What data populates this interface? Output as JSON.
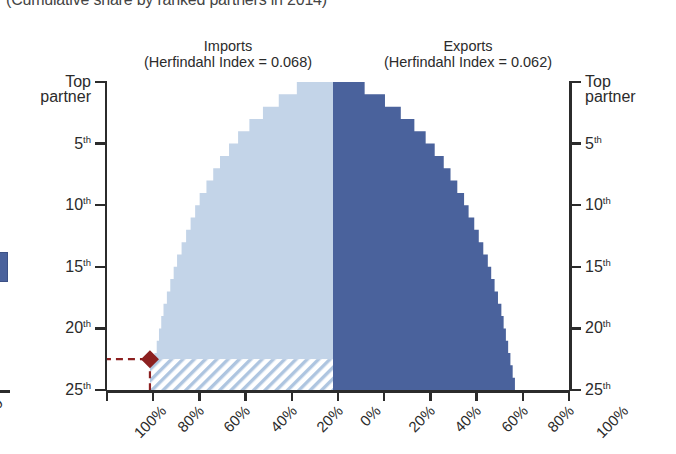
{
  "title": "(Cumulative share by ranked partners in 2014)",
  "headers": {
    "imports": {
      "name": "Imports",
      "sub": "(Herfindahl Index = 0.068)"
    },
    "exports": {
      "name": "Exports",
      "sub": "(Herfindahl Index = 0.062)"
    }
  },
  "axis_left": {
    "labels_top": "Top",
    "labels_top2": "partner",
    "ticks": [
      "5",
      "10",
      "15",
      "20",
      "25"
    ],
    "suffix": "th"
  },
  "axis_right": {
    "labels_top": "Top",
    "labels_top2": "partner",
    "ticks": [
      "5",
      "10",
      "15",
      "20",
      "25"
    ],
    "suffix": "th"
  },
  "axis_bottom": {
    "labels": [
      "100%",
      "80%",
      "60%",
      "40%",
      "20%",
      "0%",
      "20%",
      "40%",
      "60%",
      "80%",
      "100%"
    ],
    "clipped_left_label": "0"
  },
  "colors": {
    "imports_fill": "#c3d4e8",
    "exports_fill": "#4a629c",
    "hatch": "#aac3de",
    "marker": "#8c2020",
    "axis": "#2b2b2b"
  },
  "marker": {
    "name": "threshold-diamond",
    "rank": 22.5,
    "share_percent": 81
  },
  "chart_data": {
    "type": "area",
    "title": "(Cumulative share by ranked partners in 2014)",
    "xlabel": "",
    "ylabel": "Partner rank",
    "xlim": [
      -100,
      100
    ],
    "ylim": [
      1,
      25
    ],
    "grid": false,
    "legend": "none",
    "orientation": "horizontal-mirrored",
    "axis_note": "Left half shows Imports cumulative share growing right-to-left from 0% at center; right half shows Exports cumulative share growing left-to-right from 0% at center.",
    "ranks": [
      1,
      2,
      3,
      4,
      5,
      6,
      7,
      8,
      9,
      10,
      11,
      12,
      13,
      14,
      15,
      16,
      17,
      18,
      19,
      20,
      21,
      22,
      23,
      24,
      25
    ],
    "series": [
      {
        "name": "Imports",
        "herfindahl_index": 0.068,
        "side": "left",
        "cumulative_share_percent": [
          16,
          24,
          31,
          37,
          42,
          46,
          50,
          53,
          56,
          59,
          61,
          63,
          65,
          67,
          69,
          70.5,
          72,
          73.5,
          75,
          76,
          77,
          78,
          79,
          80,
          81
        ]
      },
      {
        "name": "Exports",
        "herfindahl_index": 0.062,
        "side": "right",
        "cumulative_share_percent": [
          14,
          23,
          30,
          36,
          41,
          45,
          49,
          52,
          55,
          58,
          60,
          62.5,
          64.5,
          66.5,
          68.5,
          70,
          71.5,
          73,
          74.5,
          75.5,
          76.5,
          77.5,
          78.5,
          79.5,
          80.5
        ]
      }
    ],
    "annotations": [
      {
        "name": "threshold-marker",
        "type": "diamond-with-dashed-leader",
        "x_percent": -81,
        "y_rank": 22.5,
        "color": "#8c2020"
      },
      {
        "name": "hatched-remainder",
        "type": "hatched-region",
        "description": "Diagonally hatched band below rank ~22.5 on the imports side"
      }
    ]
  }
}
